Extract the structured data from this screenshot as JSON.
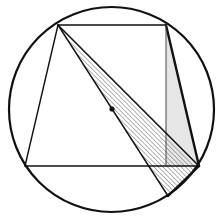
{
  "figure": {
    "type": "geometry",
    "colors": {
      "stroke": "#111111",
      "thin_stroke": "#444444",
      "hatch": "#555555",
      "light_fill": "#e6e6e6",
      "background": "#ffffff"
    },
    "circle": {
      "cx": 111.5,
      "cy": 109.5,
      "r": 102.5
    },
    "center_point": {
      "x": 112,
      "y": 109,
      "r": 2.6
    },
    "points": {
      "A": {
        "x": 58,
        "y": 25
      },
      "B": {
        "x": 166,
        "y": 25
      },
      "C": {
        "x": 199,
        "y": 166
      },
      "D": {
        "x": 25,
        "y": 166
      },
      "E": {
        "x": 166,
        "y": 166
      },
      "F": {
        "x": 168,
        "y": 196
      }
    },
    "segments": [
      {
        "from": "A",
        "to": "B",
        "weight": "normal"
      },
      {
        "from": "B",
        "to": "C",
        "weight": "bold"
      },
      {
        "from": "C",
        "to": "D",
        "weight": "normal"
      },
      {
        "from": "D",
        "to": "A",
        "weight": "normal"
      },
      {
        "from": "B",
        "to": "E",
        "weight": "thin"
      },
      {
        "from": "A",
        "to": "C",
        "weight": "normal"
      },
      {
        "from": "A",
        "to": "F",
        "weight": "normal"
      },
      {
        "from": "F",
        "to": "C",
        "weight": "bold"
      }
    ],
    "regions": [
      {
        "name": "hatched-triangle",
        "vertices": [
          "A",
          "C",
          "F"
        ],
        "fill": "hatch"
      },
      {
        "name": "light-triangle",
        "vertices": [
          "B",
          "E",
          "C"
        ],
        "fill": "light"
      }
    ]
  }
}
